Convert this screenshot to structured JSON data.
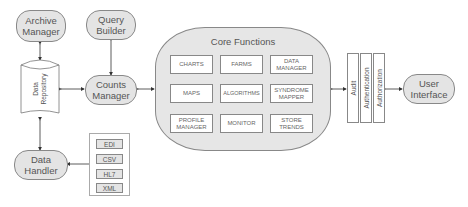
{
  "diagram": {
    "nodes": {
      "archive_manager": "Archive\nManager",
      "query_builder": "Query\nBuilder",
      "counts_manager": "Counts\nManager",
      "data_repository": "Data\nRepository",
      "data_handler": "Data\nHandler",
      "user_interface": "User\nInterface"
    },
    "core": {
      "title": "Core Functions",
      "functions": [
        "CHARTS",
        "FARMS",
        "DATA\nMANAGER",
        "MAPS",
        "ALGORITHMS",
        "SYNDROME\nMAPPER",
        "PROFILE\nMANAGER",
        "MONITOR",
        "STORE\nTRENDS"
      ]
    },
    "security_layers": [
      "Audit",
      "Authentication",
      "Authorization"
    ],
    "formats": [
      "EDI",
      "CSV",
      "HL7",
      "XML"
    ],
    "colors": {
      "node_fill": "#e4e4e4",
      "border": "#888888",
      "text": "#555555"
    }
  }
}
